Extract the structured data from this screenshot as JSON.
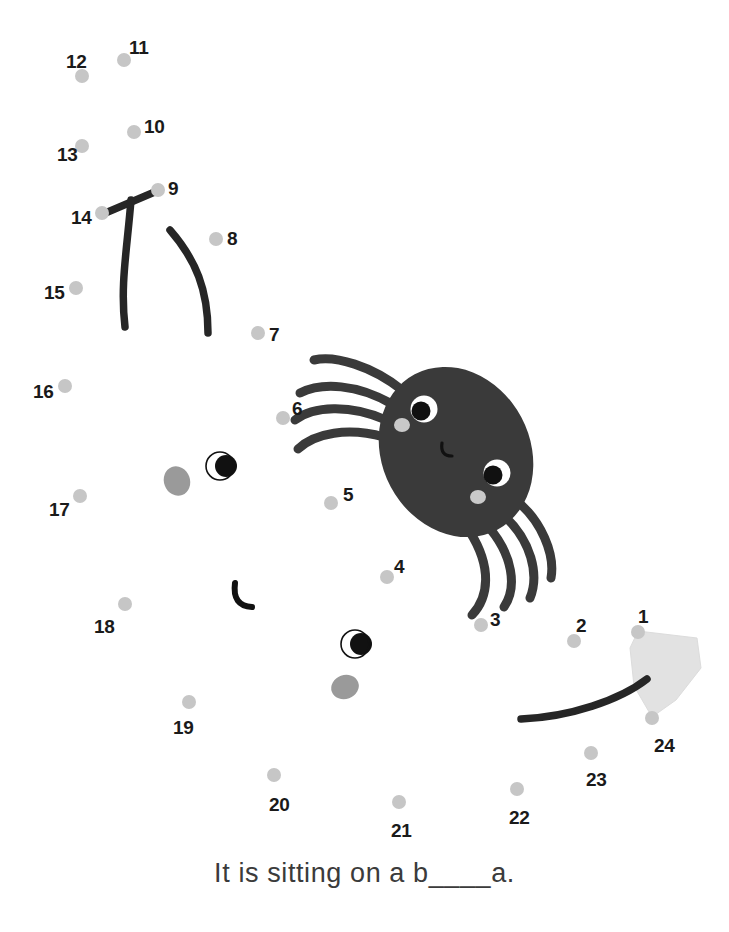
{
  "page": {
    "kind": "connect-the-dots-worksheet",
    "background_color": "#ffffff",
    "width": 729,
    "height": 932
  },
  "caption": {
    "text": "It is sitting on a b____a.",
    "color": "#3b3b3b"
  },
  "palette": {
    "dot_color": "#c6c6c6",
    "number_color": "#1a1a1a",
    "body_color": "#3a3a3a",
    "stroke_color": "#262626",
    "cheek_color": "#c9c9c9",
    "ghost_cheek_color": "#9a9a9a",
    "kite_color": "#e2e2e2",
    "kite_edge_color": "#d6d6d6",
    "eye_white": "#ffffff",
    "pupil_color": "#111111"
  },
  "dots": [
    {
      "n": "1",
      "x": 638,
      "y": 632,
      "lx": 638,
      "ly": 607
    },
    {
      "n": "2",
      "x": 574,
      "y": 641,
      "lx": 576,
      "ly": 616
    },
    {
      "n": "3",
      "x": 481,
      "y": 625,
      "lx": 490,
      "ly": 610
    },
    {
      "n": "4",
      "x": 387,
      "y": 577,
      "lx": 394,
      "ly": 557
    },
    {
      "n": "5",
      "x": 331,
      "y": 503,
      "lx": 343,
      "ly": 485
    },
    {
      "n": "6",
      "x": 283,
      "y": 418,
      "lx": 292,
      "ly": 399
    },
    {
      "n": "7",
      "x": 258,
      "y": 333,
      "lx": 269,
      "ly": 325
    },
    {
      "n": "8",
      "x": 216,
      "y": 239,
      "lx": 227,
      "ly": 229
    },
    {
      "n": "9",
      "x": 158,
      "y": 190,
      "lx": 168,
      "ly": 179
    },
    {
      "n": "10",
      "x": 134,
      "y": 132,
      "lx": 144,
      "ly": 117
    },
    {
      "n": "11",
      "x": 124,
      "y": 60,
      "lx": 129,
      "ly": 38
    },
    {
      "n": "12",
      "x": 82,
      "y": 76,
      "lx": 66,
      "ly": 52
    },
    {
      "n": "13",
      "x": 82,
      "y": 146,
      "lx": 57,
      "ly": 145
    },
    {
      "n": "14",
      "x": 102,
      "y": 213,
      "lx": 71,
      "ly": 208
    },
    {
      "n": "15",
      "x": 76,
      "y": 288,
      "lx": 44,
      "ly": 283
    },
    {
      "n": "16",
      "x": 65,
      "y": 386,
      "lx": 33,
      "ly": 382
    },
    {
      "n": "17",
      "x": 80,
      "y": 496,
      "lx": 49,
      "ly": 500
    },
    {
      "n": "18",
      "x": 125,
      "y": 604,
      "lx": 94,
      "ly": 617
    },
    {
      "n": "19",
      "x": 189,
      "y": 702,
      "lx": 173,
      "ly": 718
    },
    {
      "n": "20",
      "x": 274,
      "y": 775,
      "lx": 269,
      "ly": 795
    },
    {
      "n": "21",
      "x": 399,
      "y": 802,
      "lx": 391,
      "ly": 821
    },
    {
      "n": "22",
      "x": 517,
      "y": 789,
      "lx": 509,
      "ly": 808
    },
    {
      "n": "23",
      "x": 591,
      "y": 753,
      "lx": 586,
      "ly": 770
    },
    {
      "n": "24",
      "x": 652,
      "y": 718,
      "lx": 654,
      "ly": 736
    }
  ],
  "spider": {
    "label": "spider-figure",
    "body": {
      "cx": 456,
      "cy": 452,
      "rx": 74,
      "ry": 88,
      "rotate": -28
    },
    "eyes": [
      {
        "name": "eye-upper-left",
        "cx": 424,
        "cy": 409,
        "r": 13.5,
        "pupil_cx": 421,
        "pupil_cy": 411,
        "pupil_r": 9.5
      },
      {
        "name": "eye-lower-right",
        "cx": 497,
        "cy": 473,
        "r": 13.5,
        "pupil_cx": 493,
        "pupil_cy": 475,
        "pupil_r": 9.5
      }
    ],
    "cheeks": [
      {
        "name": "cheek-left",
        "cx": 402,
        "cy": 425,
        "rx": 8,
        "ry": 7
      },
      {
        "name": "cheek-right",
        "cx": 478,
        "cy": 497,
        "rx": 8,
        "ry": 7
      }
    ],
    "mouth": {
      "name": "mouth-curve",
      "path": "M 442 443 q -2 13 10 13"
    },
    "legs_upper": [
      "M 402 390 C 372 366 335 355 314 360",
      "M 392 404 C 357 384 322 382 300 393",
      "M 386 420 C 350 404 313 406 295 420",
      "M 384 437 C 348 427 315 433 298 449"
    ],
    "legs_lower": [
      "M 512 497 C 543 520 555 556 551 578",
      "M 500 512 C 533 540 539 576 530 598",
      "M 486 524 C 514 555 517 588 504 607",
      "M 470 532 C 492 567 489 597 472 615"
    ]
  },
  "ghost_marks": {
    "label": "decorative-ghost-face-pieces",
    "eyes": [
      {
        "name": "ghost-eye-upper",
        "cx": 220,
        "cy": 466,
        "r": 14,
        "pupil_cx": 226,
        "pupil_cy": 466,
        "pupil_r": 11
      },
      {
        "name": "ghost-eye-lower",
        "cx": 355,
        "cy": 644,
        "r": 14,
        "pupil_cx": 361,
        "pupil_cy": 644,
        "pupil_r": 11
      }
    ],
    "cheeks": [
      {
        "name": "ghost-cheek-upper",
        "cx": 177,
        "cy": 481,
        "rx": 13,
        "ry": 15,
        "rotate": -20
      },
      {
        "name": "ghost-cheek-lower",
        "cx": 345,
        "cy": 687,
        "rx": 14,
        "ry": 12,
        "rotate": -20
      }
    ],
    "mouth": {
      "name": "ghost-mouth-curve",
      "path": "M 235 583 q -3 23 17 24"
    }
  },
  "strokes": {
    "label": "partial-drawn-lines",
    "items": [
      {
        "name": "stroke-14-to-9",
        "path": "M 103 214 L 157 191"
      },
      {
        "name": "stroke-long-leg-left",
        "path": "M 131 200 C 127 250 120 285 125 327"
      },
      {
        "name": "stroke-long-leg-mid",
        "path": "M 170 230 C 196 260 208 290 208 333"
      },
      {
        "name": "stroke-kite-tail",
        "path": "M 521 719 C 570 717 620 700 647 679"
      }
    ]
  },
  "kite": {
    "name": "banana-kite-shape",
    "points": "638,631 697,638 701,668 676,700 652,717 634,686 630,648",
    "fill": "#e2e2e2"
  }
}
